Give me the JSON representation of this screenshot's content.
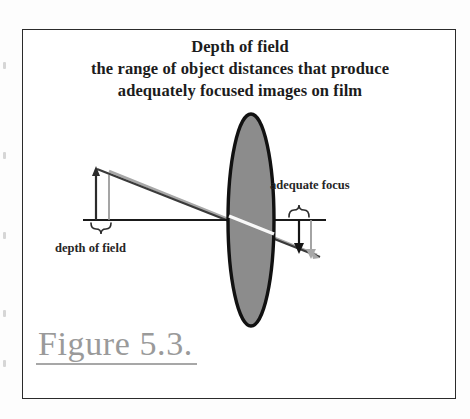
{
  "page": {
    "background_color": "#fdfdfd",
    "border_color": "#2b2b2b"
  },
  "title": {
    "line1": "Depth of field",
    "line2": "the range of object distances that produce",
    "line3": "adequately focused images on film"
  },
  "labels": {
    "depth_of_field": "depth of field",
    "adequate_focus": "adequate focus"
  },
  "caption": {
    "figure_number": "Figure 5.3."
  },
  "colors": {
    "lens_fill": "#8c8c8c",
    "lens_stroke": "#111111",
    "ray_dark": "#3a3a3a",
    "ray_gray": "#a8a8a8",
    "axis": "#1a1a1a",
    "text": "#262626",
    "caption_text": "#9a9a9a"
  },
  "diagram": {
    "type": "optics-ray-diagram",
    "optical_axis_y": 190,
    "lens": {
      "name": "converging-lens",
      "center_x": 228,
      "center_y": 190,
      "rx": 23,
      "ry": 106
    },
    "object_arrows": [
      {
        "name": "object-arrow-near",
        "x": 73,
        "y_base": 190,
        "y_tip": 140,
        "color": "#2b2b2b",
        "direction": "up"
      },
      {
        "name": "object-arrow-far",
        "x": 86,
        "y_base": 190,
        "y_tip": 141,
        "color": "#a8a8a8",
        "direction": "up"
      }
    ],
    "image_arrows": [
      {
        "name": "image-arrow-near",
        "x": 276,
        "y_base": 190,
        "y_tip": 222,
        "color": "#1a1a1a",
        "direction": "down"
      },
      {
        "name": "image-arrow-far",
        "x": 288,
        "y_base": 190,
        "y_tip": 226,
        "color": "#a8a8a8",
        "direction": "down"
      }
    ],
    "braces": [
      {
        "name": "depth-of-field-brace",
        "x_start": 70,
        "x_end": 90,
        "y": 196,
        "orientation": "down"
      },
      {
        "name": "adequate-focus-brace",
        "x_start": 266,
        "x_end": 290,
        "y": 184,
        "orientation": "up"
      }
    ],
    "rays": [
      {
        "name": "ray-dark",
        "from_x": 74,
        "from_y": 139,
        "to_x": 296,
        "to_y": 226,
        "color": "#3a3a3a"
      },
      {
        "name": "ray-gray",
        "from_x": 86,
        "from_y": 141,
        "to_x": 292,
        "to_y": 224,
        "color": "#a8a8a8"
      }
    ]
  }
}
